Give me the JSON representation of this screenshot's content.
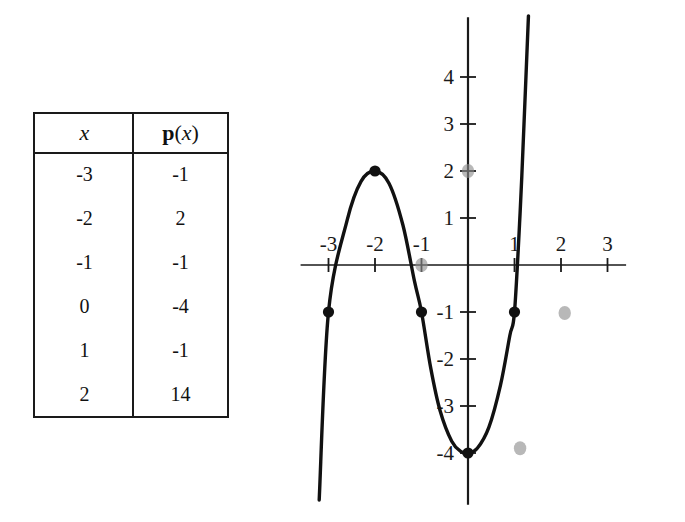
{
  "table": {
    "name": "table-of-values",
    "headers": [
      "x",
      "p(x)"
    ],
    "header_x": "x",
    "header_px_bold": "p",
    "header_px_open": "(",
    "header_px_var": "x",
    "header_px_close": ")",
    "rows": [
      {
        "x": "-3",
        "px": "-1"
      },
      {
        "x": "-2",
        "px": "2"
      },
      {
        "x": "-1",
        "px": "-1"
      },
      {
        "x": "0",
        "px": "-4"
      },
      {
        "x": "1",
        "px": "-1"
      },
      {
        "x": "2",
        "px": "14"
      }
    ]
  },
  "chart_data": {
    "type": "line",
    "title": "",
    "xlabel": "",
    "ylabel": "",
    "xlim": [
      -3.6,
      3.4
    ],
    "ylim": [
      -5.1,
      5.4
    ],
    "grid": false,
    "legend": null,
    "x_ticks": [
      -3,
      -2,
      -1,
      1,
      2,
      3
    ],
    "x_tick_labels": [
      "-3",
      "-2",
      "-1",
      "1",
      "2",
      "3"
    ],
    "y_ticks": [
      4,
      3,
      2,
      1,
      -1,
      -2,
      -3,
      -4
    ],
    "y_tick_labels": [
      "4",
      "3",
      "2",
      "1",
      "-1",
      "-2",
      "-3",
      "-4"
    ],
    "series": [
      {
        "name": "p(x)",
        "color": "#111111",
        "marked_points": [
          {
            "x": -3,
            "y": -1
          },
          {
            "x": -2,
            "y": 2
          },
          {
            "x": -1,
            "y": -1
          },
          {
            "x": 0,
            "y": -4
          },
          {
            "x": 1,
            "y": -1
          }
        ],
        "points": [
          {
            "x": -3.2,
            "y": -5.0
          },
          {
            "x": -3.0,
            "y": -1.0
          },
          {
            "x": -2.6,
            "y": 0.95
          },
          {
            "x": -2.3,
            "y": 1.78
          },
          {
            "x": -2.0,
            "y": 2.0
          },
          {
            "x": -1.7,
            "y": 1.74
          },
          {
            "x": -1.4,
            "y": 0.85
          },
          {
            "x": -1.15,
            "y": -0.35
          },
          {
            "x": -1.0,
            "y": -1.0
          },
          {
            "x": -0.8,
            "y": -2.2
          },
          {
            "x": -0.6,
            "y": -3.1
          },
          {
            "x": -0.35,
            "y": -3.75
          },
          {
            "x": -0.15,
            "y": -3.97
          },
          {
            "x": 0.0,
            "y": -4.0
          },
          {
            "x": 0.2,
            "y": -3.9
          },
          {
            "x": 0.45,
            "y": -3.45
          },
          {
            "x": 0.7,
            "y": -2.55
          },
          {
            "x": 0.9,
            "y": -1.5
          },
          {
            "x": 1.0,
            "y": -1.0
          },
          {
            "x": 1.12,
            "y": 1.1
          },
          {
            "x": 1.2,
            "y": 2.9
          },
          {
            "x": 1.3,
            "y": 5.3
          }
        ]
      }
    ],
    "artifacts": [
      {
        "name": "scan-smudge-0-2",
        "x": 0,
        "y": 2
      },
      {
        "name": "scan-smudge-neg1-0",
        "x": -1,
        "y": 0
      },
      {
        "name": "scan-smudge-2-neg1",
        "x": 2.08,
        "y": -1.02
      },
      {
        "name": "scan-smudge-2-neg4",
        "x": 1.12,
        "y": -3.9
      }
    ]
  }
}
